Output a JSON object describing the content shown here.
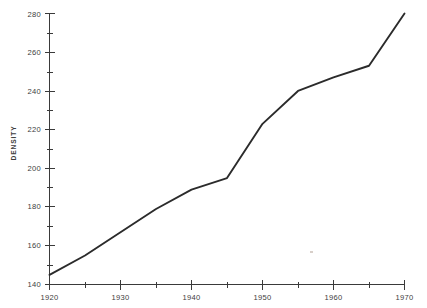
{
  "chart_data": {
    "type": "line",
    "title": "",
    "xlabel": "",
    "ylabel": "DENSITY",
    "xlim": [
      1920,
      1970
    ],
    "ylim": [
      140,
      280
    ],
    "grid": false,
    "legend": null,
    "x_major_ticks": [
      1920,
      1930,
      1940,
      1950,
      1960,
      1970
    ],
    "x_major_tick_labels": [
      "1920",
      "1930",
      "1940",
      "1950",
      "1960",
      "1970"
    ],
    "x_minor_ticks": [
      1925,
      1935,
      1945,
      1955,
      1965
    ],
    "y_major_ticks": [
      140,
      160,
      180,
      200,
      220,
      240,
      260,
      280
    ],
    "y_major_tick_labels": [
      "140",
      "160",
      "180",
      "200",
      "220",
      "240",
      "260",
      "280"
    ],
    "y_minor_ticks": [
      150,
      170,
      190,
      210,
      230,
      250,
      270
    ],
    "series": [
      {
        "name": "Density",
        "x": [
          1920,
          1925,
          1930,
          1935,
          1940,
          1945,
          1950,
          1955,
          1960,
          1965,
          1970
        ],
        "values": [
          145,
          155,
          167,
          179,
          189,
          195,
          223,
          240,
          247,
          253,
          280
        ]
      }
    ]
  },
  "axes": {
    "y_title": "DENSITY"
  }
}
